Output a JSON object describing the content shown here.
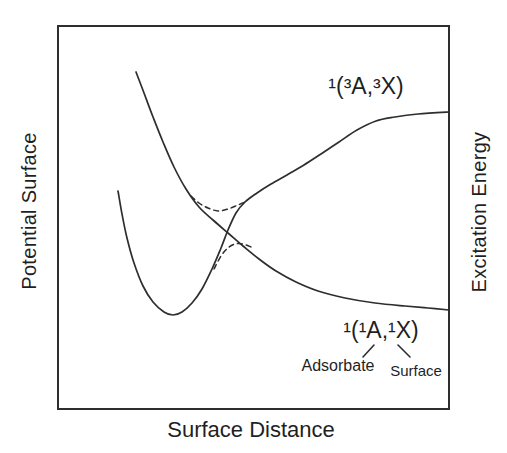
{
  "figure": {
    "background_color": "#ffffff",
    "ink_color": "#2e2e2e",
    "text_color": "#1f1f1f"
  },
  "labels": {
    "y_left": "Potential Surface",
    "y_right": "Excitation Energy",
    "x_bottom": "Surface Distance",
    "upper_state": "¹(³A,³X)",
    "lower_state": "¹(¹A,¹X)",
    "adsorbate": "Adsorbate",
    "surface": "Surface"
  },
  "chart_data": {
    "type": "line",
    "title": "",
    "xlabel": "Surface Distance",
    "ylabel_left": "Potential Surface",
    "ylabel_right": "Excitation Energy",
    "axes_note": "qualitative schematic; no tick marks or numeric scales; coordinates below are page pixels (y down)",
    "grid": false,
    "legend": "none (curves labeled by in-plot annotations)",
    "plot_box_px": {
      "left": 58,
      "top": 26,
      "right": 449,
      "bottom": 409,
      "stroke_width": 2
    },
    "series": [
      {
        "id": "curve-triplet-state",
        "name": "¹(³A,³X) state: bound well rising to excitation plateau",
        "style": "solid",
        "stroke_width": 1.7,
        "points_px": [
          [
            118,
            191
          ],
          [
            122,
            214
          ],
          [
            127,
            238
          ],
          [
            134,
            263
          ],
          [
            143,
            286
          ],
          [
            153,
            302
          ],
          [
            164,
            312
          ],
          [
            173,
            315
          ],
          [
            182,
            312
          ],
          [
            192,
            303
          ],
          [
            202,
            289
          ],
          [
            212,
            269
          ],
          [
            221,
            248
          ],
          [
            228,
            230
          ],
          [
            236,
            213
          ],
          [
            245,
            202
          ],
          [
            257,
            193
          ],
          [
            271,
            184
          ],
          [
            287,
            175
          ],
          [
            304,
            165
          ],
          [
            321,
            154
          ],
          [
            339,
            142
          ],
          [
            357,
            130
          ],
          [
            376,
            121
          ],
          [
            395,
            117
          ],
          [
            418,
            114
          ],
          [
            449,
            112
          ]
        ]
      },
      {
        "id": "curve-singlet-state",
        "name": "¹(¹A,¹X) state: steep repulsive descent flattening at large distance",
        "style": "solid",
        "stroke_width": 1.7,
        "points_px": [
          [
            136,
            72
          ],
          [
            144,
            93
          ],
          [
            153,
            117
          ],
          [
            163,
            142
          ],
          [
            174,
            167
          ],
          [
            186,
            189
          ],
          [
            199,
            207
          ],
          [
            213,
            220
          ],
          [
            228,
            233
          ],
          [
            243,
            246
          ],
          [
            259,
            259
          ],
          [
            276,
            271
          ],
          [
            296,
            282
          ],
          [
            318,
            291
          ],
          [
            345,
            298
          ],
          [
            375,
            303
          ],
          [
            405,
            306
          ],
          [
            428,
            308
          ],
          [
            449,
            310
          ]
        ]
      },
      {
        "id": "avoided-crossing-upper",
        "name": "avoided-crossing upper adiabatic branch (dashed)",
        "style": "dashed",
        "stroke_width": 1.5,
        "points_px": [
          [
            191,
            196
          ],
          [
            199,
            203
          ],
          [
            208,
            208
          ],
          [
            218,
            211
          ],
          [
            228,
            209
          ],
          [
            238,
            205
          ],
          [
            247,
            201
          ]
        ]
      },
      {
        "id": "avoided-crossing-lower",
        "name": "avoided-crossing lower adiabatic branch (dashed)",
        "style": "dashed",
        "stroke_width": 1.5,
        "points_px": [
          [
            214,
            269
          ],
          [
            221,
            256
          ],
          [
            228,
            248
          ],
          [
            235,
            244
          ],
          [
            243,
            244
          ],
          [
            251,
            247
          ]
        ]
      }
    ],
    "annotations": [
      {
        "id": "upper-state-label",
        "text": "¹(³A,³X)",
        "center_px": [
          366,
          86
        ]
      },
      {
        "id": "lower-state-label",
        "text": "¹(¹A,¹X)",
        "center_px": [
          381,
          330
        ]
      },
      {
        "id": "adsorbate-label",
        "text": "Adsorbate",
        "center_px": [
          338,
          366
        ]
      },
      {
        "id": "surface-label",
        "text": "Surface",
        "center_px": [
          416,
          370
        ]
      }
    ],
    "leader_lines": [
      {
        "id": "adsorbate-pointer-line",
        "from_px": [
          374,
          345
        ],
        "to_px": [
          363,
          357
        ]
      },
      {
        "id": "surface-pointer-line",
        "from_px": [
          398,
          345
        ],
        "to_px": [
          410,
          357
        ]
      }
    ]
  }
}
